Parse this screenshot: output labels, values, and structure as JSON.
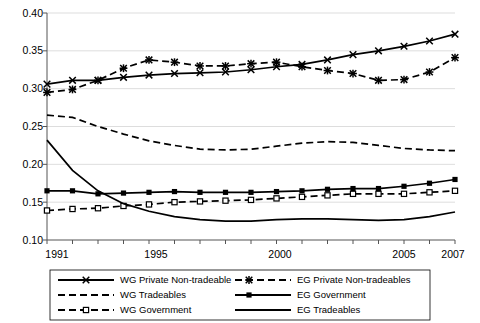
{
  "chart_data": {
    "type": "line",
    "title": "",
    "subtitle": "",
    "xlabel": "",
    "ylabel": "",
    "xlim": [
      1991,
      2007
    ],
    "ylim": [
      0.1,
      0.4
    ],
    "grid": true,
    "grid_axis": "y",
    "legend_position": "bottom",
    "legend_columns": 2,
    "x": [
      1991,
      1992,
      1993,
      1994,
      1995,
      1996,
      1997,
      1998,
      1999,
      2000,
      2001,
      2002,
      2003,
      2004,
      2005,
      2006,
      2007
    ],
    "xticks": [
      1991,
      1992,
      1993,
      1994,
      1995,
      1996,
      1997,
      1998,
      1999,
      2000,
      2001,
      2002,
      2003,
      2004,
      2005,
      2006,
      2007
    ],
    "xtick_labels_shown": [
      "1991",
      "1995",
      "2000",
      "2005",
      "2007"
    ],
    "yticks": [
      0.1,
      0.15,
      0.2,
      0.25,
      0.3,
      0.35,
      0.4
    ],
    "ytick_labels": [
      "0.10",
      "0.15",
      "0.20",
      "0.25",
      "0.30",
      "0.35",
      "0.40"
    ],
    "series": [
      {
        "name": "WG Private Non-tradeable",
        "marker": "x",
        "line_style": "solid",
        "color": "#000000",
        "values": [
          0.306,
          0.311,
          0.311,
          0.315,
          0.318,
          0.32,
          0.321,
          0.322,
          0.325,
          0.329,
          0.332,
          0.338,
          0.345,
          0.35,
          0.356,
          0.363,
          0.372
        ]
      },
      {
        "name": "EG Private Non-tradeables",
        "marker": "star",
        "line_style": "dashed",
        "color": "#000000",
        "values": [
          0.295,
          0.299,
          0.311,
          0.327,
          0.338,
          0.335,
          0.33,
          0.33,
          0.333,
          0.335,
          0.329,
          0.324,
          0.32,
          0.311,
          0.312,
          0.322,
          0.341
        ]
      },
      {
        "name": "WG Tradeables",
        "marker": "none",
        "line_style": "dashed",
        "color": "#000000",
        "values": [
          0.265,
          0.262,
          0.25,
          0.24,
          0.231,
          0.225,
          0.22,
          0.219,
          0.22,
          0.224,
          0.228,
          0.23,
          0.229,
          0.225,
          0.221,
          0.219,
          0.218
        ]
      },
      {
        "name": "EG Government",
        "marker": "square-filled",
        "line_style": "solid",
        "color": "#000000",
        "values": [
          0.165,
          0.165,
          0.161,
          0.162,
          0.163,
          0.164,
          0.163,
          0.163,
          0.163,
          0.164,
          0.165,
          0.167,
          0.168,
          0.168,
          0.171,
          0.175,
          0.18
        ]
      },
      {
        "name": "WG Government",
        "marker": "square-open",
        "line_style": "dashed",
        "color": "#000000",
        "values": [
          0.139,
          0.141,
          0.142,
          0.145,
          0.147,
          0.15,
          0.151,
          0.152,
          0.153,
          0.155,
          0.157,
          0.159,
          0.161,
          0.161,
          0.161,
          0.163,
          0.165
        ]
      },
      {
        "name": "EG Tradeables",
        "marker": "none",
        "line_style": "solid",
        "color": "#000000",
        "values": [
          0.232,
          0.192,
          0.165,
          0.148,
          0.138,
          0.131,
          0.127,
          0.125,
          0.125,
          0.127,
          0.128,
          0.128,
          0.127,
          0.126,
          0.127,
          0.131,
          0.137
        ]
      }
    ]
  },
  "axis": {
    "y_labels": [
      "0.40",
      "0.35",
      "0.30",
      "0.25",
      "0.20",
      "0.15",
      "0.10"
    ],
    "x_labels": [
      "1991",
      "1995",
      "2000",
      "2005",
      "2007"
    ]
  },
  "legend": {
    "column_left": [
      {
        "label": "WG Private Non-tradeable",
        "key": "wg-private-non-tradeable"
      },
      {
        "label": "WG Tradeables",
        "key": "wg-tradeables"
      },
      {
        "label": "WG Government",
        "key": "wg-government"
      }
    ],
    "column_right": [
      {
        "label": "EG Private Non-tradeables",
        "key": "eg-private-non-tradeables"
      },
      {
        "label": "EG Government",
        "key": "eg-government"
      },
      {
        "label": "EG Tradeables",
        "key": "eg-tradeables"
      }
    ]
  }
}
